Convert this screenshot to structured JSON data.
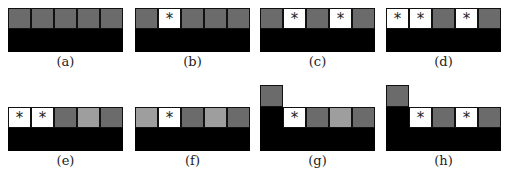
{
  "figure": {
    "colors": {
      "dark": "#6b6b6b",
      "light": "#9e9e9e",
      "white": "#ffffff",
      "black": "#000000"
    },
    "marker": "*",
    "panels": [
      {
        "label": "(a)",
        "cells": [
          "dark",
          "dark",
          "dark",
          "dark",
          "dark"
        ],
        "marks": [
          "",
          "",
          "",
          "",
          ""
        ],
        "raised": false
      },
      {
        "label": "(b)",
        "cells": [
          "dark",
          "white",
          "dark",
          "dark",
          "dark"
        ],
        "marks": [
          "",
          "*",
          "",
          "",
          ""
        ],
        "raised": false
      },
      {
        "label": "(c)",
        "cells": [
          "dark",
          "white",
          "dark",
          "white",
          "dark"
        ],
        "marks": [
          "",
          "*",
          "",
          "*",
          ""
        ],
        "raised": false
      },
      {
        "label": "(d)",
        "cells": [
          "white",
          "white",
          "dark",
          "white",
          "dark"
        ],
        "marks": [
          "*",
          "*",
          "",
          "*",
          ""
        ],
        "raised": false
      },
      {
        "label": "(e)",
        "cells": [
          "white",
          "white",
          "dark",
          "light",
          "dark"
        ],
        "marks": [
          "*",
          "*",
          "",
          "",
          ""
        ],
        "raised": false
      },
      {
        "label": "(f)",
        "cells": [
          "light",
          "white",
          "dark",
          "light",
          "dark"
        ],
        "marks": [
          "",
          "*",
          "",
          "",
          ""
        ],
        "raised": false
      },
      {
        "label": "(g)",
        "cells": [
          "black",
          "white",
          "dark",
          "light",
          "dark"
        ],
        "marks": [
          "",
          "*",
          "",
          "",
          ""
        ],
        "raised": true
      },
      {
        "label": "(h)",
        "cells": [
          "black",
          "white",
          "dark",
          "white",
          "dark"
        ],
        "marks": [
          "",
          "*",
          "",
          "*",
          ""
        ],
        "raised": true
      }
    ]
  }
}
